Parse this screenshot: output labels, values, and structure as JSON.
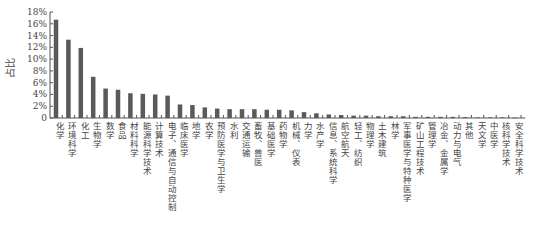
{
  "chart_data": {
    "type": "bar",
    "title": "",
    "xlabel": "",
    "ylabel": "占比",
    "ylim": [
      0,
      18
    ],
    "yticks": [
      "0",
      "2%",
      "4%",
      "6%",
      "8%",
      "10%",
      "12%",
      "14%",
      "16%",
      "18%"
    ],
    "grid": false,
    "legend": null,
    "bar_color": "#5a5a5a",
    "categories": [
      "化学",
      "环境科学",
      "化工",
      "生物学",
      "数学",
      "食品",
      "材料科学",
      "能源科学技术",
      "计算技术",
      "电子、通信与自动控制",
      "临床医学",
      "地学",
      "农学",
      "预防医学与卫生学",
      "水利",
      "交通运输",
      "畜牧、兽医",
      "基础医学",
      "药物学",
      "机械、仪表",
      "力学",
      "水产学",
      "信息、系统科学",
      "航空航天",
      "轻工、纺织",
      "物理学",
      "土木建筑",
      "林学",
      "军事医学与特种医学",
      "矿山工程技术",
      "管理学",
      "冶金、金属学",
      "动力与电气",
      "其他",
      "天文学",
      "中医学",
      "核科学技术",
      "安全科学技术"
    ],
    "values": [
      16.7,
      13.3,
      11.9,
      7.0,
      5.0,
      4.8,
      4.2,
      4.1,
      4.0,
      3.8,
      2.3,
      2.2,
      1.8,
      1.6,
      1.5,
      1.5,
      1.5,
      1.4,
      1.4,
      1.3,
      1.0,
      0.8,
      0.6,
      0.5,
      0.4,
      0.4,
      0.3,
      0.3,
      0.3,
      0.2,
      0.2,
      0.2,
      0.2,
      0.15,
      0.1,
      0.1,
      0.1,
      0.05
    ]
  }
}
